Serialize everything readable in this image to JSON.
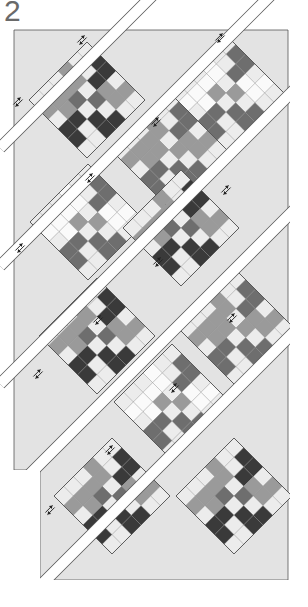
{
  "diagram": {
    "step_label": "2",
    "colors": {
      "background": "#ffffff",
      "setting_triangle": "#e3e3e3",
      "outline": "#555555",
      "sashing": "#ffffff",
      "dark": "#3a3a3a",
      "medium_dark": "#6e6e6e",
      "medium": "#9a9a9a",
      "light": "#d6d6d6",
      "very_light": "#ececec",
      "white": "#fafafa"
    },
    "setting_triangles": [
      {
        "points": "14,30 74,30 14,88"
      },
      {
        "points": "92,33 212,33 152,93"
      },
      {
        "points": "230,33 288,33 288,92"
      },
      {
        "points": "14,108 72,166 14,224"
      },
      {
        "points": "288,112 288,228 230,170"
      },
      {
        "points": "14,244 72,302 14,360"
      },
      {
        "points": "288,232 288,410 246,368"
      },
      {
        "points": "40,360 100,420 40,480 40,580 288,580 288,430 250,468 130,580 100,580 40,520"
      }
    ],
    "bottom_panel": {
      "points": "40,470 40,580 288,580 288,470"
    },
    "sashing_strips": [
      {
        "x1": 0,
        "y1": 148,
        "x2": 290,
        "y2": -142
      },
      {
        "x1": 0,
        "y1": 266,
        "x2": 310,
        "y2": -44
      },
      {
        "x1": 0,
        "y1": 384,
        "x2": 310,
        "y2": 74
      },
      {
        "x1": 20,
        "y1": 484,
        "x2": 310,
        "y2": 194
      },
      {
        "x1": 36,
        "y1": 590,
        "x2": 310,
        "y2": 316
      }
    ],
    "blocks": [
      {
        "cx": 87,
        "cy": 100,
        "tone": "dark"
      },
      {
        "cx": 226,
        "cy": 93,
        "tone": "white"
      },
      {
        "cx": 169,
        "cy": 150,
        "tone": "medium"
      },
      {
        "cx": 88,
        "cy": 222,
        "tone": "white"
      },
      {
        "cx": 181,
        "cy": 228,
        "tone": "dark"
      },
      {
        "cx": 97,
        "cy": 336,
        "tone": "dark"
      },
      {
        "cx": 236,
        "cy": 328,
        "tone": "medium"
      },
      {
        "cx": 172,
        "cy": 402,
        "tone": "white"
      },
      {
        "cx": 112,
        "cy": 496,
        "tone": "dark"
      },
      {
        "cx": 234,
        "cy": 496,
        "tone": "dark"
      }
    ],
    "pressing_arrows": [
      {
        "x": 82,
        "y": 40
      },
      {
        "x": 220,
        "y": 38
      },
      {
        "x": 18,
        "y": 102
      },
      {
        "x": 156,
        "y": 122
      },
      {
        "x": 90,
        "y": 178
      },
      {
        "x": 226,
        "y": 190
      },
      {
        "x": 20,
        "y": 248
      },
      {
        "x": 158,
        "y": 262
      },
      {
        "x": 98,
        "y": 320
      },
      {
        "x": 232,
        "y": 318
      },
      {
        "x": 38,
        "y": 374
      },
      {
        "x": 174,
        "y": 388
      },
      {
        "x": 110,
        "y": 450
      },
      {
        "x": 50,
        "y": 510
      }
    ]
  }
}
